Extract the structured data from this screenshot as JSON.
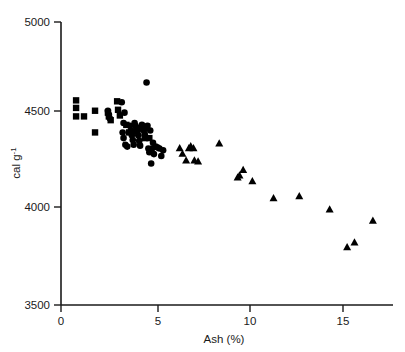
{
  "chart_data": {
    "type": "scatter",
    "title": "",
    "xlabel": "Ash   (%)",
    "ylabel": "cal g-1",
    "ylabel_base": "cal g",
    "ylabel_exponent": "-1",
    "xlim": [
      0,
      18.0
    ],
    "ylim": [
      3500,
      5000
    ],
    "xticks": [
      0,
      5,
      10,
      15
    ],
    "xtick_labels": [
      "0",
      "5",
      "10",
      "15"
    ],
    "yticks": [
      3500,
      4000,
      4500,
      5000
    ],
    "ytick_labels": [
      "3500",
      "4000",
      "4500",
      "5000"
    ],
    "grid": false,
    "legend": false,
    "marker_color": "#000000",
    "series": [
      {
        "name": "squares",
        "marker": "square",
        "points": [
          [
            0.82,
            4585
          ],
          [
            0.82,
            4545
          ],
          [
            0.82,
            4500
          ],
          [
            1.25,
            4500
          ],
          [
            1.85,
            4530
          ],
          [
            1.85,
            4415
          ],
          [
            2.55,
            4520
          ],
          [
            2.6,
            4500
          ],
          [
            2.7,
            4480
          ],
          [
            3.05,
            4580
          ],
          [
            3.1,
            4535
          ],
          [
            3.2,
            4505
          ],
          [
            3.55,
            4455
          ],
          [
            3.7,
            4415
          ],
          [
            4.05,
            4420
          ],
          [
            4.3,
            4435
          ],
          [
            4.55,
            4385
          ],
          [
            4.8,
            4385
          ]
        ]
      },
      {
        "name": "circles",
        "marker": "circle",
        "points": [
          [
            2.55,
            4530
          ],
          [
            2.6,
            4510
          ],
          [
            2.65,
            4490
          ],
          [
            3.3,
            4575
          ],
          [
            3.45,
            4520
          ],
          [
            3.4,
            4465
          ],
          [
            3.35,
            4415
          ],
          [
            3.4,
            4385
          ],
          [
            3.5,
            4350
          ],
          [
            3.6,
            4340
          ],
          [
            3.75,
            4450
          ],
          [
            3.8,
            4425
          ],
          [
            3.85,
            4400
          ],
          [
            3.9,
            4375
          ],
          [
            3.95,
            4350
          ],
          [
            4.0,
            4465
          ],
          [
            4.05,
            4450
          ],
          [
            4.1,
            4440
          ],
          [
            4.15,
            4420
          ],
          [
            4.2,
            4400
          ],
          [
            4.25,
            4370
          ],
          [
            4.3,
            4345
          ],
          [
            4.4,
            4455
          ],
          [
            4.45,
            4440
          ],
          [
            4.5,
            4425
          ],
          [
            4.55,
            4405
          ],
          [
            4.6,
            4440
          ],
          [
            4.65,
            4680
          ],
          [
            4.7,
            4450
          ],
          [
            4.75,
            4330
          ],
          [
            4.8,
            4310
          ],
          [
            4.85,
            4425
          ],
          [
            4.9,
            4250
          ],
          [
            4.95,
            4330
          ],
          [
            5.0,
            4360
          ],
          [
            5.05,
            4300
          ],
          [
            5.15,
            4340
          ],
          [
            5.25,
            4335
          ],
          [
            5.35,
            4330
          ],
          [
            5.45,
            4290
          ],
          [
            5.55,
            4320
          ]
        ]
      },
      {
        "name": "triangles",
        "marker": "triangle",
        "points": [
          [
            6.45,
            4330
          ],
          [
            6.6,
            4300
          ],
          [
            6.8,
            4265
          ],
          [
            6.95,
            4330
          ],
          [
            7.05,
            4340
          ],
          [
            7.2,
            4330
          ],
          [
            7.25,
            4265
          ],
          [
            7.45,
            4260
          ],
          [
            8.6,
            4355
          ],
          [
            9.6,
            4175
          ],
          [
            9.7,
            4185
          ],
          [
            9.9,
            4215
          ],
          [
            10.4,
            4155
          ],
          [
            11.55,
            4065
          ],
          [
            12.95,
            4075
          ],
          [
            14.6,
            4005
          ],
          [
            15.55,
            3805
          ],
          [
            15.95,
            3830
          ],
          [
            16.95,
            3945
          ]
        ]
      }
    ]
  },
  "axes": {
    "origin_px": [
      61,
      305
    ],
    "x_scale_px_per_unit": 18.4,
    "y_scale_px_per_unit": 0.1886
  }
}
